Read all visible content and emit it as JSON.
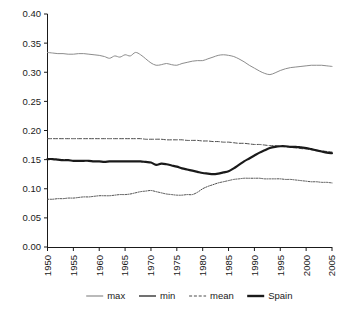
{
  "chart_data": {
    "type": "line",
    "title": "",
    "subtitle": "",
    "xlabel": "",
    "ylabel": "",
    "xlim": [
      1950,
      2005
    ],
    "ylim": [
      0.0,
      0.4
    ],
    "grid": false,
    "legend_position": "bottom",
    "x_ticks": [
      "1950",
      "1955",
      "1960",
      "1965",
      "1970",
      "1975",
      "1980",
      "1985",
      "1990",
      "1995",
      "2000",
      "2005"
    ],
    "y_ticks": [
      "0.00",
      "0.05",
      "0.10",
      "0.15",
      "0.20",
      "0.25",
      "0.30",
      "0.35",
      "0.40"
    ],
    "x": [
      1950,
      1951,
      1952,
      1953,
      1954,
      1955,
      1956,
      1957,
      1958,
      1959,
      1960,
      1961,
      1962,
      1963,
      1964,
      1965,
      1966,
      1967,
      1968,
      1969,
      1970,
      1971,
      1972,
      1973,
      1974,
      1975,
      1976,
      1977,
      1978,
      1979,
      1980,
      1981,
      1982,
      1983,
      1984,
      1985,
      1986,
      1987,
      1988,
      1989,
      1990,
      1991,
      1992,
      1993,
      1994,
      1995,
      1996,
      1997,
      1998,
      1999,
      2000,
      2001,
      2002,
      2003,
      2004,
      2005
    ],
    "series": [
      {
        "name": "max",
        "color": "#8c8c8c",
        "style": "solid",
        "width": 1.0,
        "values": [
          0.334,
          0.333,
          0.332,
          0.332,
          0.331,
          0.331,
          0.332,
          0.332,
          0.331,
          0.33,
          0.329,
          0.327,
          0.324,
          0.328,
          0.326,
          0.33,
          0.328,
          0.334,
          0.33,
          0.323,
          0.316,
          0.312,
          0.313,
          0.315,
          0.313,
          0.312,
          0.315,
          0.317,
          0.319,
          0.32,
          0.32,
          0.323,
          0.326,
          0.329,
          0.33,
          0.329,
          0.327,
          0.323,
          0.318,
          0.312,
          0.307,
          0.302,
          0.298,
          0.296,
          0.299,
          0.303,
          0.306,
          0.308,
          0.309,
          0.31,
          0.311,
          0.312,
          0.312,
          0.312,
          0.311,
          0.31
        ]
      },
      {
        "name": "min",
        "color": "#4d4d4d",
        "style": "dotted",
        "width": 1.0,
        "values": [
          0.082,
          0.082,
          0.083,
          0.083,
          0.084,
          0.084,
          0.085,
          0.086,
          0.086,
          0.087,
          0.088,
          0.088,
          0.088,
          0.089,
          0.09,
          0.09,
          0.091,
          0.093,
          0.095,
          0.096,
          0.097,
          0.095,
          0.093,
          0.091,
          0.09,
          0.089,
          0.089,
          0.09,
          0.09,
          0.094,
          0.1,
          0.104,
          0.107,
          0.11,
          0.112,
          0.114,
          0.116,
          0.117,
          0.118,
          0.118,
          0.118,
          0.118,
          0.117,
          0.117,
          0.117,
          0.117,
          0.116,
          0.116,
          0.115,
          0.114,
          0.113,
          0.112,
          0.112,
          0.111,
          0.111,
          0.11
        ]
      },
      {
        "name": "mean",
        "color": "#4d4d4d",
        "style": "dashed",
        "width": 1.0,
        "values": [
          0.186,
          0.186,
          0.186,
          0.186,
          0.186,
          0.186,
          0.186,
          0.186,
          0.186,
          0.186,
          0.186,
          0.186,
          0.186,
          0.186,
          0.186,
          0.186,
          0.186,
          0.186,
          0.186,
          0.185,
          0.185,
          0.185,
          0.185,
          0.184,
          0.184,
          0.184,
          0.184,
          0.183,
          0.183,
          0.183,
          0.182,
          0.182,
          0.181,
          0.181,
          0.18,
          0.18,
          0.179,
          0.178,
          0.178,
          0.177,
          0.176,
          0.176,
          0.175,
          0.174,
          0.174,
          0.173,
          0.172,
          0.171,
          0.17,
          0.169,
          0.168,
          0.167,
          0.166,
          0.165,
          0.164,
          0.163
        ]
      },
      {
        "name": "Spain",
        "color": "#1a1a1a",
        "style": "solid",
        "width": 2.2,
        "values": [
          0.151,
          0.151,
          0.15,
          0.149,
          0.149,
          0.148,
          0.148,
          0.148,
          0.148,
          0.147,
          0.147,
          0.146,
          0.147,
          0.147,
          0.147,
          0.147,
          0.147,
          0.147,
          0.147,
          0.146,
          0.145,
          0.141,
          0.143,
          0.142,
          0.14,
          0.138,
          0.135,
          0.133,
          0.131,
          0.129,
          0.127,
          0.126,
          0.125,
          0.126,
          0.128,
          0.13,
          0.135,
          0.141,
          0.147,
          0.152,
          0.157,
          0.162,
          0.166,
          0.17,
          0.172,
          0.173,
          0.173,
          0.172,
          0.172,
          0.171,
          0.17,
          0.168,
          0.166,
          0.164,
          0.162,
          0.161
        ]
      }
    ],
    "legend": [
      {
        "label": "max",
        "color": "#8c8c8c",
        "style": "solid",
        "width": 1.2
      },
      {
        "label": "min",
        "color": "#4d4d4d",
        "style": "solid",
        "width": 1.6
      },
      {
        "label": "mean",
        "color": "#4d4d4d",
        "style": "dashed",
        "width": 1.2
      },
      {
        "label": "Spain",
        "color": "#1a1a1a",
        "style": "solid",
        "width": 2.4
      }
    ]
  },
  "axes": {
    "y_labels": [
      "0.40",
      "0.35",
      "0.30",
      "0.25",
      "0.20",
      "0.15",
      "0.10",
      "0.05",
      "0.00"
    ],
    "x_labels": [
      "1950",
      "1955",
      "1960",
      "1965",
      "1970",
      "1975",
      "1980",
      "1985",
      "1990",
      "1995",
      "2000",
      "2005"
    ]
  },
  "legend": {
    "items": [
      "max",
      "min",
      "mean",
      "Spain"
    ]
  },
  "colors": {
    "axis": "#1a1a1a",
    "max_line": "#8c8c8c",
    "min_line": "#4d4d4d",
    "mean_line": "#4d4d4d",
    "spain_line": "#1a1a1a",
    "background": "#ffffff"
  }
}
